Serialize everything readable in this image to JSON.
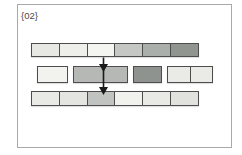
{
  "figure": {
    "label": "{02}",
    "colors": {
      "background": "#ffffff",
      "frame_border": "#a9a9a9",
      "cell_border": "#4d4d4d",
      "arrow": "#1a1a1a",
      "label_text": "#4a4a4a"
    },
    "top_strip": {
      "cells": [
        {
          "name": "top-cell-1",
          "fill": "#e7e7e4"
        },
        {
          "name": "top-cell-2",
          "fill": "#eeeeea"
        },
        {
          "name": "top-cell-3",
          "fill": "#f4f4f1"
        },
        {
          "name": "top-cell-4",
          "fill": "#c4c7c4"
        },
        {
          "name": "top-cell-5",
          "fill": "#abafac"
        },
        {
          "name": "top-cell-6",
          "fill": "#91958f"
        }
      ]
    },
    "middle_strip": {
      "groups": [
        {
          "cells": [
            {
              "name": "mid-group1-cell-1",
              "fill": "#f2f2ee"
            }
          ]
        },
        {
          "cells": [
            {
              "name": "mid-group2-cell-1",
              "fill": "#b5b8b5"
            }
          ]
        },
        {
          "cells": [
            {
              "name": "mid-group3-cell-1",
              "fill": "#8f938f"
            }
          ]
        },
        {
          "cells": [
            {
              "name": "mid-group4-cell-1",
              "fill": "#eaeae6"
            },
            {
              "name": "mid-group4-cell-2",
              "fill": "#eaeae6"
            }
          ]
        }
      ]
    },
    "bottom_strip": {
      "cells": [
        {
          "name": "bottom-cell-1",
          "fill": "#e9e9e5"
        },
        {
          "name": "bottom-cell-2",
          "fill": "#e4e4e1"
        },
        {
          "name": "bottom-cell-3",
          "fill": "#c0c3c0"
        },
        {
          "name": "bottom-cell-4",
          "fill": "#f1f1ee"
        },
        {
          "name": "bottom-cell-5",
          "fill": "#e9e9e6"
        },
        {
          "name": "bottom-cell-6",
          "fill": "#e1e1de"
        }
      ]
    },
    "arrows": [
      {
        "name": "flow-arrow-top-to-middle"
      },
      {
        "name": "flow-arrow-middle-to-bottom"
      }
    ]
  }
}
